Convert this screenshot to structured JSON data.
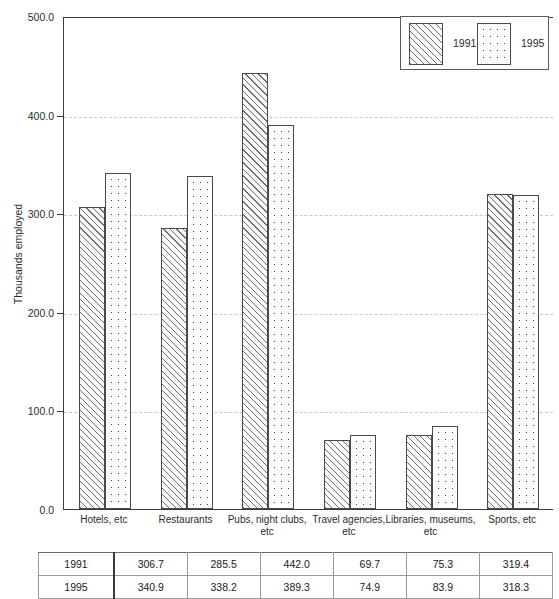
{
  "chart_data": {
    "type": "bar",
    "title": "",
    "subtitle": "",
    "xlabel": "",
    "ylabel": "Thousands employed",
    "ylim": [
      0.0,
      500.0
    ],
    "y_ticks": [
      "0.0",
      "100.0",
      "200.0",
      "300.0",
      "400.0",
      "500.0"
    ],
    "y_tick_values": [
      0.0,
      100.0,
      200.0,
      300.0,
      400.0,
      500.0
    ],
    "grid": "horizontal-dashed",
    "legend_position": "top-right",
    "categories": [
      "Hotels, etc",
      "Restaurants",
      "Pubs, night clubs, etc",
      "Travel agencies, etc",
      "Libraries, museums, etc",
      "Sports, etc"
    ],
    "series": [
      {
        "name": "1991",
        "pattern": "diagonal-hatch",
        "values": [
          306.7,
          285.5,
          442.0,
          69.7,
          75.3,
          319.4
        ]
      },
      {
        "name": "1995",
        "pattern": "dots",
        "values": [
          340.9,
          338.2,
          389.3,
          74.9,
          83.9,
          318.3
        ]
      }
    ]
  },
  "legend": {
    "items": [
      {
        "label": "1991",
        "pattern": "hatch"
      },
      {
        "label": "1995",
        "pattern": "dots"
      }
    ]
  },
  "x_labels": [
    {
      "line1": "Hotels, etc",
      "line2": ""
    },
    {
      "line1": "Restaurants",
      "line2": ""
    },
    {
      "line1": "Pubs, night clubs,",
      "line2": "etc"
    },
    {
      "line1": "Travel agencies,",
      "line2": "etc"
    },
    {
      "line1": "Libraries, museums,",
      "line2": "etc"
    },
    {
      "line1": "Sports, etc",
      "line2": ""
    }
  ],
  "table": {
    "rows": [
      {
        "year": "1991",
        "values": [
          "306.7",
          "285.5",
          "442.0",
          "69.7",
          "75.3",
          "319.4"
        ]
      },
      {
        "year": "1995",
        "values": [
          "340.9",
          "338.2",
          "389.3",
          "74.9",
          "83.9",
          "318.3"
        ]
      }
    ]
  },
  "colors": {
    "axis": "#3c3c3c",
    "grid": "#c8c8c8",
    "bar_outline": "#4a4a4a",
    "text": "#2b2b2b",
    "background": "#ffffff"
  }
}
